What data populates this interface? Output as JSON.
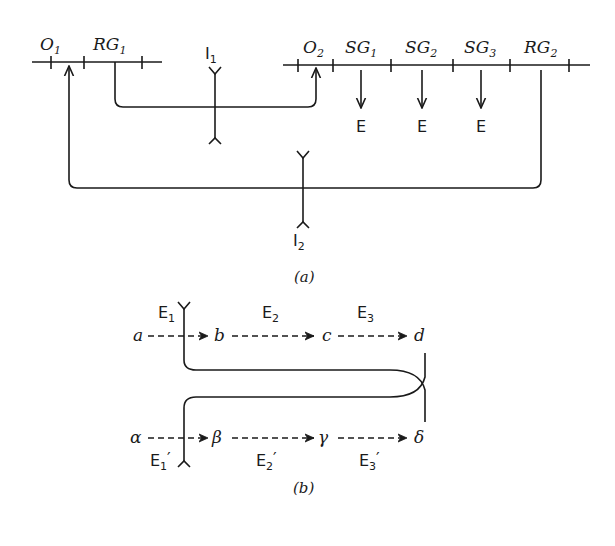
{
  "figure_a": {
    "caption": "(a)",
    "left_line_labels": [
      {
        "base": "O",
        "sub": "1"
      },
      {
        "base": "RG",
        "sub": "1"
      }
    ],
    "right_line_labels": [
      {
        "base": "O",
        "sub": "2"
      },
      {
        "base": "SG",
        "sub": "1"
      },
      {
        "base": "SG",
        "sub": "2"
      },
      {
        "base": "SG",
        "sub": "3"
      },
      {
        "base": "RG",
        "sub": "2"
      }
    ],
    "interfaces": [
      {
        "base": "I",
        "sub": "1"
      },
      {
        "base": "I",
        "sub": "2"
      }
    ],
    "emit_labels": [
      "E",
      "E",
      "E"
    ]
  },
  "figure_b": {
    "caption": "(b)",
    "top_row": [
      "a",
      "b",
      "c",
      "d"
    ],
    "bottom_row": [
      "α",
      "β",
      "γ",
      "δ"
    ],
    "top_events": [
      {
        "base": "E",
        "sub": "1",
        "prime": ""
      },
      {
        "base": "E",
        "sub": "2",
        "prime": ""
      },
      {
        "base": "E",
        "sub": "3",
        "prime": ""
      }
    ],
    "bottom_events": [
      {
        "base": "E",
        "sub": "1",
        "prime": "′"
      },
      {
        "base": "E",
        "sub": "2",
        "prime": "′"
      },
      {
        "base": "E",
        "sub": "3",
        "prime": "′"
      }
    ]
  }
}
